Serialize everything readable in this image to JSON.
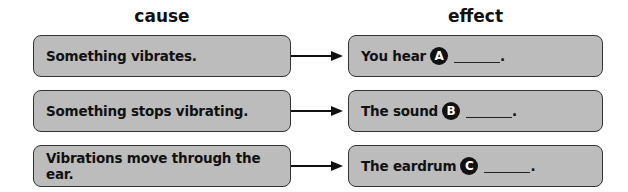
{
  "headers": {
    "cause": "cause",
    "effect": "effect"
  },
  "rows": [
    {
      "cause": "Something vibrates.",
      "effect_prefix": "You hear",
      "badge": "A",
      "effect_suffix": "."
    },
    {
      "cause": "Something stops vibrating.",
      "effect_prefix": "The sound",
      "badge": "B",
      "effect_suffix": "."
    },
    {
      "cause": "Vibrations move through the ear.",
      "effect_prefix": "The eardrum",
      "badge": "C",
      "effect_suffix": "."
    }
  ],
  "colors": {
    "box_fill": "#bcbcbc",
    "border": "#333333",
    "badge": "#111111"
  }
}
